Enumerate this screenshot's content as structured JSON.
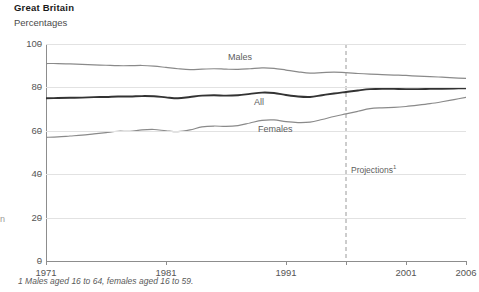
{
  "header": {
    "title": "Great Britain",
    "subtitle": "Percentages"
  },
  "footnote": "1 Males aged 16 to 64, females aged 16 to 59.",
  "edge_remnant": "n",
  "annotations": {
    "projection_label": "Projections",
    "projection_superscript": "1",
    "projection_year": 1996
  },
  "series_labels": {
    "males": "Males",
    "all": "All",
    "females": "Females"
  },
  "colors": {
    "males_line": "#8a8a8a",
    "all_line": "#333333",
    "females_line": "#8a8a8a",
    "grid": "#e2e2e2",
    "axis": "#8d8d8d",
    "text": "#555555",
    "title": "#1a1a1a",
    "projection_rule": "#9a9a9a",
    "background": "#ffffff"
  },
  "chart_data": {
    "type": "line",
    "title": "Great Britain",
    "subtitle": "Percentages",
    "xlabel": "",
    "ylabel": "",
    "ylim": [
      0,
      100
    ],
    "xlim": [
      1971,
      2006
    ],
    "yticks": [
      0,
      20,
      40,
      60,
      80,
      100
    ],
    "xticks": [
      1971,
      1981,
      1991,
      1996,
      2001,
      2006
    ],
    "xtick_labels": [
      "1971",
      "1981",
      "1991",
      "",
      "2001",
      "2006"
    ],
    "grid": true,
    "grid_axis": "y",
    "legend": "inline-labels",
    "projection_start": 1996,
    "x": [
      1971,
      1972,
      1973,
      1974,
      1975,
      1976,
      1977,
      1978,
      1979,
      1980,
      1981,
      1982,
      1983,
      1984,
      1985,
      1986,
      1987,
      1988,
      1989,
      1990,
      1991,
      1992,
      1993,
      1994,
      1995,
      1996,
      1997,
      1998,
      1999,
      2000,
      2001,
      2002,
      2003,
      2004,
      2005,
      2006
    ],
    "series": [
      {
        "name": "Males",
        "color": "#8a8a8a",
        "width": 1.2,
        "values": [
          91.0,
          91.0,
          90.8,
          90.6,
          90.4,
          90.2,
          90.0,
          90.0,
          90.1,
          89.8,
          89.2,
          88.6,
          88.2,
          88.4,
          88.6,
          88.4,
          88.3,
          88.6,
          89.0,
          88.8,
          88.0,
          87.2,
          86.6,
          86.8,
          87.0,
          86.8,
          86.4,
          86.1,
          85.9,
          85.7,
          85.5,
          85.2,
          85.0,
          84.7,
          84.4,
          84.2
        ]
      },
      {
        "name": "All",
        "color": "#333333",
        "width": 1.9,
        "values": [
          75.0,
          75.1,
          75.2,
          75.3,
          75.5,
          75.6,
          75.8,
          75.8,
          76.0,
          75.9,
          75.4,
          75.0,
          75.6,
          76.2,
          76.4,
          76.2,
          76.4,
          77.0,
          77.6,
          77.4,
          76.5,
          75.8,
          75.6,
          76.4,
          77.2,
          77.9,
          78.6,
          79.2,
          79.4,
          79.3,
          79.2,
          79.2,
          79.3,
          79.4,
          79.5,
          79.6
        ]
      },
      {
        "name": "Females",
        "color": "#8a8a8a",
        "width": 1.2,
        "values": [
          57.0,
          57.2,
          57.6,
          58.0,
          58.6,
          59.2,
          59.8,
          59.8,
          60.4,
          60.6,
          60.0,
          59.6,
          60.4,
          61.8,
          62.2,
          62.0,
          62.4,
          63.6,
          64.8,
          65.0,
          64.2,
          63.8,
          64.0,
          65.2,
          66.6,
          67.8,
          69.0,
          70.2,
          70.6,
          70.8,
          71.2,
          71.8,
          72.5,
          73.4,
          74.4,
          75.4
        ]
      }
    ]
  }
}
